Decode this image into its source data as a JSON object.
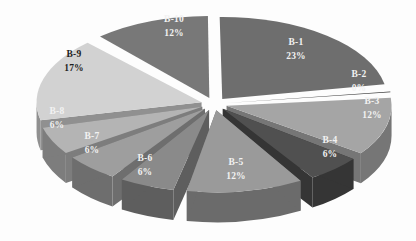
{
  "chart_data": {
    "type": "pie",
    "title": "",
    "subtitle": "",
    "xlabel": "",
    "ylabel": "",
    "legend_position": "none",
    "grid": false,
    "exploded": true,
    "three_d": true,
    "background_color": "#fdfdfd",
    "categories": [
      "B-1",
      "B-2",
      "B-3",
      "B-4",
      "B-5",
      "B-6",
      "B-7",
      "B-8",
      "B-9",
      "B-10"
    ],
    "values": [
      23,
      0,
      12,
      6,
      12,
      6,
      6,
      6,
      17,
      12
    ],
    "value_unit": "%",
    "labels": [
      "B-1\n23%",
      "B-2\n0%",
      "B-3\n12%",
      "B-4\n6%",
      "B-5\n12%",
      "B-6\n6%",
      "B-7\n6%",
      "B-8\n6%",
      "B-9\n17%",
      "B-10\n12%"
    ],
    "slices": [
      {
        "name": "B-1",
        "pct_text": "23%",
        "value": 23,
        "color": "#6e6e6e",
        "side_color": "#4a4a4a",
        "label_fill": "#f2f2f2"
      },
      {
        "name": "B-2",
        "pct_text": "0%",
        "value": 0,
        "color": "#3c3c3c",
        "side_color": "#2a2a2a",
        "label_fill": "#f2f2f2"
      },
      {
        "name": "B-3",
        "pct_text": "12%",
        "value": 12,
        "color": "#a5a5a5",
        "side_color": "#767676",
        "label_fill": "#f2f2f2"
      },
      {
        "name": "B-4",
        "pct_text": "6%",
        "value": 6,
        "color": "#505050",
        "side_color": "#353535",
        "label_fill": "#f2f2f2"
      },
      {
        "name": "B-5",
        "pct_text": "12%",
        "value": 12,
        "color": "#9a9a9a",
        "side_color": "#6b6b6b",
        "label_fill": "#f2f2f2"
      },
      {
        "name": "B-6",
        "pct_text": "6%",
        "value": 6,
        "color": "#8a8a8a",
        "side_color": "#5e5e5e",
        "label_fill": "#f2f2f2"
      },
      {
        "name": "B-7",
        "pct_text": "6%",
        "value": 6,
        "color": "#9e9e9e",
        "side_color": "#6e6e6e",
        "label_fill": "#f2f2f2"
      },
      {
        "name": "B-8",
        "pct_text": "6%",
        "value": 6,
        "color": "#b4b4b4",
        "side_color": "#7d7d7d",
        "label_fill": "#f7f7f7"
      },
      {
        "name": "B-9",
        "pct_text": "17%",
        "value": 17,
        "color": "#d2d2d2",
        "side_color": "#909090",
        "label_fill": "#1d1d1d"
      },
      {
        "name": "B-10",
        "pct_text": "12%",
        "value": 12,
        "color": "#787878",
        "side_color": "#505050",
        "label_fill": "#f2f2f2"
      }
    ],
    "label_positions": [
      {
        "name": "B-1",
        "x": 296,
        "y": 45,
        "y2": 59
      },
      {
        "name": "B-2",
        "x": 359,
        "y": 77,
        "y2": 91
      },
      {
        "name": "B-3",
        "x": 372,
        "y": 104,
        "y2": 118
      },
      {
        "name": "B-4",
        "x": 330,
        "y": 143,
        "y2": 157
      },
      {
        "name": "B-5",
        "x": 236,
        "y": 165,
        "y2": 179
      },
      {
        "name": "B-6",
        "x": 145,
        "y": 161,
        "y2": 175
      },
      {
        "name": "B-7",
        "x": 92,
        "y": 139,
        "y2": 153
      },
      {
        "name": "B-8",
        "x": 57,
        "y": 114,
        "y2": 128
      },
      {
        "name": "B-9",
        "x": 74,
        "y": 57,
        "y2": 71
      },
      {
        "name": "B-10",
        "x": 174,
        "y": 22,
        "y2": 36
      }
    ]
  }
}
